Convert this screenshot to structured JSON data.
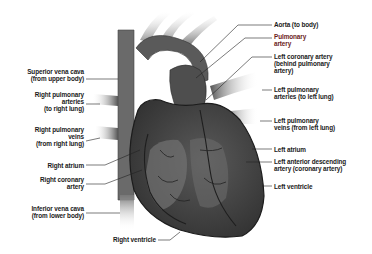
{
  "diagram": {
    "colors": {
      "tissue": "#3c3c3c",
      "tissue_light": "#6e6e6e",
      "vessel": "#555555",
      "leader": "#222222",
      "highlight_label": "#6b1c1c"
    },
    "labels_left": [
      {
        "id": "superior-vena-cava",
        "text": "Superior vena cava\n(from upper body)"
      },
      {
        "id": "right-pulmonary-arteries",
        "text": "Right pulmonary\narteries\n(to right lung)"
      },
      {
        "id": "right-pulmonary-veins",
        "text": "Right pulmonary\nveins\n(from right lung)"
      },
      {
        "id": "right-atrium",
        "text": "Right atrium"
      },
      {
        "id": "right-coronary-artery",
        "text": "Right coronary\nartery"
      },
      {
        "id": "inferior-vena-cava",
        "text": "Inferior vena cava\n(from lower body)"
      }
    ],
    "labels_bottom": [
      {
        "id": "right-ventricle",
        "text": "Right ventricle"
      }
    ],
    "labels_right": [
      {
        "id": "aorta",
        "text": "Aorta (to body)"
      },
      {
        "id": "pulmonary-artery",
        "text": "Pulmonary\nartery"
      },
      {
        "id": "left-coronary-artery",
        "text": "Left coronary artery\n(behind pulmonary\nartery)"
      },
      {
        "id": "left-pulmonary-arteries",
        "text": "Left pulmonary\narteries (to left lung)"
      },
      {
        "id": "left-pulmonary-veins",
        "text": "Left pulmonary\nveins (from left lung)"
      },
      {
        "id": "left-atrium",
        "text": "Left atrium"
      },
      {
        "id": "left-anterior-descending",
        "text": "Left anterior descending\nartery (coronary artery)"
      },
      {
        "id": "left-ventricle",
        "text": "Left ventricle"
      }
    ]
  }
}
